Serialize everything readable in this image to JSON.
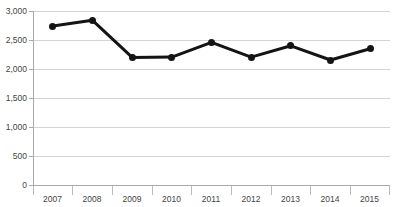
{
  "chart_data": {
    "type": "line",
    "title": "",
    "subtitle": "",
    "xlabel": "",
    "ylabel": "",
    "categories": [
      "2007",
      "2008",
      "2009",
      "2010",
      "2011",
      "2012",
      "2013",
      "2014",
      "2015"
    ],
    "values": [
      2740,
      2840,
      2200,
      2205,
      2460,
      2205,
      2400,
      2155,
      2350
    ],
    "series": [
      {
        "name": "",
        "values": [
          2740,
          2840,
          2200,
          2205,
          2460,
          2205,
          2400,
          2155,
          2350
        ]
      }
    ],
    "ylim": [
      0,
      3000
    ],
    "ytick_values": [
      0,
      500,
      1000,
      1500,
      2000,
      2500,
      3000
    ],
    "ytick_labels": [
      "0",
      "500",
      "1,000",
      "1,500",
      "2,000",
      "2,500",
      "3,000"
    ],
    "grid": true,
    "grid_axis": "y",
    "legend": false,
    "legend_position": "none",
    "annotations": [],
    "colors": {
      "line": "#141414",
      "marker": "#141414",
      "gridline": "#d4d4d4",
      "axis": "#a8a8a8",
      "background": "#ffffff",
      "text": "#444444"
    },
    "line_width_px": 3,
    "marker_size_px": 7
  }
}
